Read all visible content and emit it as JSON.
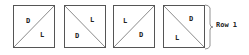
{
  "diagram": {
    "tiles": [
      {
        "diagonal": "bottom-left-to-top-right",
        "upper_label": "D",
        "lower_label": "L"
      },
      {
        "diagonal": "top-left-to-bottom-right",
        "upper_label": "L",
        "lower_label": "D"
      },
      {
        "diagonal": "bottom-left-to-top-right",
        "upper_label": "L",
        "lower_label": "D"
      },
      {
        "diagonal": "top-left-to-bottom-right",
        "upper_label": "D",
        "lower_label": "L"
      }
    ],
    "row_label": "Row 1",
    "stroke_color": "#555555"
  }
}
